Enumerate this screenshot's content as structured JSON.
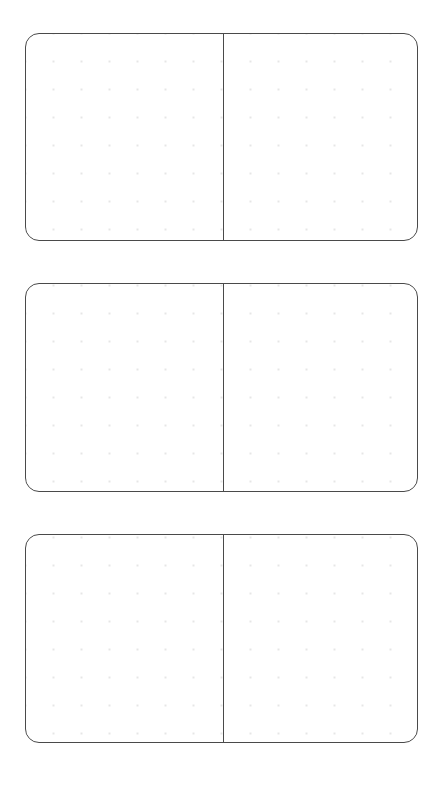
{
  "document": {
    "title": "Dotted Spread Template",
    "page_background": "#ffffff",
    "canvas_width": 443,
    "canvas_height": 797
  },
  "style": {
    "card_border_color": "#4a4a4a",
    "card_border_width": 1.5,
    "card_corner_radius": 14,
    "card_fill": "#ffffff",
    "spine_color": "#4a4a4a",
    "spine_width": 1,
    "dot_color": "#e6e6e6",
    "dot_radius": 0.85,
    "dot_spacing_x": 28,
    "dot_spacing_y": 28,
    "dot_origin_x": 54,
    "dot_origin_y": 62,
    "dot_columns_per_half": 6,
    "dot_rows": 6
  },
  "layout": {
    "card_left": 25,
    "card_right": 418,
    "card_width": 393,
    "card_height": 208,
    "spine_x_offset": 197,
    "gap_between_cards": 42
  },
  "cards": [
    {
      "id": "spread-1",
      "label": "Spread 1",
      "top": 33,
      "left": 25,
      "width": 393,
      "height": 208,
      "spine_offset": 197,
      "panels": [
        {
          "id": "spread-1-left",
          "label": "Left Page",
          "side": "left",
          "content": ""
        },
        {
          "id": "spread-1-right",
          "label": "Right Page",
          "side": "right",
          "content": ""
        }
      ]
    },
    {
      "id": "spread-2",
      "label": "Spread 2",
      "top": 283,
      "left": 25,
      "width": 393,
      "height": 209,
      "spine_offset": 197,
      "panels": [
        {
          "id": "spread-2-left",
          "label": "Left Page",
          "side": "left",
          "content": ""
        },
        {
          "id": "spread-2-right",
          "label": "Right Page",
          "side": "right",
          "content": ""
        }
      ]
    },
    {
      "id": "spread-3",
      "label": "Spread 3",
      "top": 534,
      "left": 25,
      "width": 393,
      "height": 209,
      "spine_offset": 197,
      "panels": [
        {
          "id": "spread-3-left",
          "label": "Left Page",
          "side": "left",
          "content": ""
        },
        {
          "id": "spread-3-right",
          "label": "Right Page",
          "side": "right",
          "content": ""
        }
      ]
    }
  ]
}
